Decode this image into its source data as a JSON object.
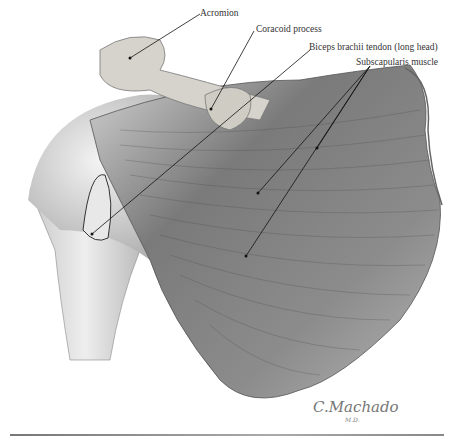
{
  "figure": {
    "labels": [
      {
        "id": "acromion",
        "text": "Acromion"
      },
      {
        "id": "coracoid",
        "text": "Coracoid process"
      },
      {
        "id": "biceps",
        "text": "Biceps brachii tendon (long head)"
      },
      {
        "id": "subscapularis",
        "text": "Subscapularis muscle"
      }
    ],
    "signature": {
      "name": "C.Machado",
      "suffix": "M.D."
    }
  },
  "colors": {
    "muscle_dark": "#5a5a5a",
    "muscle_mid": "#8a8a8a",
    "bone": "#d8d4cc",
    "background": "#ffffff",
    "leader": "#111111"
  }
}
